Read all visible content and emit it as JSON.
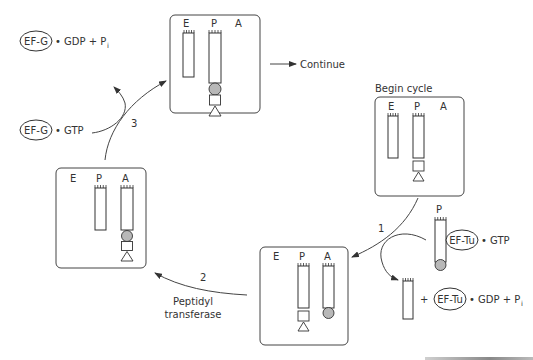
{
  "diagram": {
    "sites": {
      "e": "E",
      "p": "P",
      "a": "A"
    },
    "begin_label": "Begin cycle",
    "continue_label": "Continue",
    "steps": {
      "step1": {
        "number": "1"
      },
      "step2": {
        "number": "2",
        "enzyme_line1": "Peptidyl",
        "enzyme_line2": "transferase"
      },
      "step3": {
        "number": "3"
      }
    },
    "factors": {
      "ef_tu": "EF-Tu",
      "ef_g": "EF-G",
      "gtp": "• GTP",
      "gdp_pi": "• GDP + P",
      "pi_sub": "i",
      "plus": "+"
    },
    "incoming_trna_site": "P",
    "colors": {
      "stroke": "#333333",
      "amino_acid_fill": "#b8b8b8",
      "background": "#ffffff"
    }
  }
}
